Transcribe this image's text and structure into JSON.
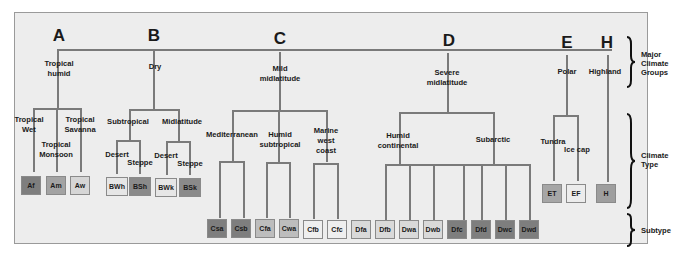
{
  "diagram": {
    "colors": {
      "dark": "#7e7e7e",
      "medium": "#a6a6a6",
      "light": "#d9d9d9",
      "lightest": "#efefef",
      "line": "#7a7a7a",
      "panel": "#ededed"
    },
    "groups": [
      {
        "letter": "A",
        "name": "Tropical humid"
      },
      {
        "letter": "B",
        "name": "Dry"
      },
      {
        "letter": "C",
        "name": "Mild midlatitude"
      },
      {
        "letter": "D",
        "name": "Severe midlatitude"
      },
      {
        "letter": "E",
        "name": "Polar"
      },
      {
        "letter": "H",
        "name": "Highland"
      }
    ],
    "group_name_lines": {
      "A1": "Tropical",
      "A2": "humid",
      "B1": "Dry",
      "C1": "Mild",
      "C2": "midlatitude",
      "D1": "Severe",
      "D2": "midlatitude",
      "E1": "Polar",
      "H1": "Highland"
    },
    "types": {
      "trop_wet_1": "Tropical",
      "trop_wet_2": "Wet",
      "trop_mon_1": "Tropical",
      "trop_mon_2": "Monsoon",
      "trop_sav_1": "Tropical",
      "trop_sav_2": "Savanna",
      "subtropical": "Subtropical",
      "midlatitude": "Midlatitude",
      "desert_1": "Desert",
      "steppe_1": "Steppe",
      "desert_2": "Desert",
      "steppe_2": "Steppe",
      "mediterranean": "Mediterranean",
      "humid_sub_1": "Humid",
      "humid_sub_2": "subtropical",
      "marine_1": "Marine",
      "marine_2": "west",
      "marine_3": "coast",
      "humid_cont_1": "Humid",
      "humid_cont_2": "continental",
      "subarctic": "Subarctic",
      "tundra": "Tundra",
      "icecap": "Ice cap"
    },
    "codes": [
      {
        "code": "Af",
        "shade": "#7e7e7e"
      },
      {
        "code": "Am",
        "shade": "#a3a3a3"
      },
      {
        "code": "Aw",
        "shade": "#d6d6d6"
      },
      {
        "code": "BWh",
        "shade": "#e6e6e6"
      },
      {
        "code": "BSh",
        "shade": "#8a8a8a"
      },
      {
        "code": "BWk",
        "shade": "#e6e6e6"
      },
      {
        "code": "BSk",
        "shade": "#8a8a8a"
      },
      {
        "code": "Csa",
        "shade": "#7e7e7e"
      },
      {
        "code": "Csb",
        "shade": "#7e7e7e"
      },
      {
        "code": "Cfa",
        "shade": "#bdbdbd"
      },
      {
        "code": "Cwa",
        "shade": "#bdbdbd"
      },
      {
        "code": "Cfb",
        "shade": "#efefef"
      },
      {
        "code": "Cfc",
        "shade": "#efefef"
      },
      {
        "code": "Dfa",
        "shade": "#d9d9d9"
      },
      {
        "code": "Dfb",
        "shade": "#d9d9d9"
      },
      {
        "code": "Dwa",
        "shade": "#d9d9d9"
      },
      {
        "code": "Dwb",
        "shade": "#d9d9d9"
      },
      {
        "code": "Dfc",
        "shade": "#7e7e7e"
      },
      {
        "code": "Dfd",
        "shade": "#7e7e7e"
      },
      {
        "code": "Dwc",
        "shade": "#7e7e7e"
      },
      {
        "code": "Dwd",
        "shade": "#7e7e7e"
      },
      {
        "code": "ET",
        "shade": "#a6a6a6"
      },
      {
        "code": "EF",
        "shade": "#ececec"
      },
      {
        "code": "H",
        "shade": "#9e9e9e"
      }
    ],
    "legend": {
      "groups_1": "Major",
      "groups_2": "Climate",
      "groups_3": "Groups",
      "type_1": "Climate",
      "type_2": "Type",
      "subtype": "Subtype"
    }
  }
}
